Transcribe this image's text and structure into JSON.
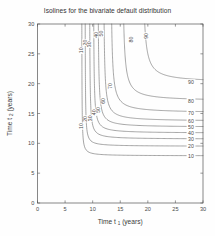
{
  "figure": {
    "title": "Isolines for the bivariate default distribution",
    "background_color": "#ffffff",
    "line_color": "#6f6f6f",
    "axis_color": "#555555",
    "text_color": "#3a3a3a"
  },
  "chart_data": {
    "type": "line",
    "subtype": "contour",
    "title": "Isolines for the bivariate default distribution",
    "xlabel": "Time t_1 (years)",
    "xlabel_main": "Time t",
    "xlabel_sub": "1",
    "xlabel_unit": "(years)",
    "ylabel": "Time t_2 (years)",
    "ylabel_main": "Time t",
    "ylabel_sub": "2",
    "ylabel_unit": "(years)",
    "xlim": [
      0,
      30
    ],
    "ylim": [
      0,
      30
    ],
    "xticks": [
      0,
      5,
      10,
      15,
      20,
      25,
      30
    ],
    "yticks": [
      0,
      5,
      10,
      15,
      20,
      25,
      30
    ],
    "xticklabels": [
      "0",
      "5",
      "10",
      "15",
      "20",
      "25",
      "30"
    ],
    "yticklabels": [
      "0",
      "5",
      "10",
      "15",
      "20",
      "25",
      "30"
    ],
    "grid": false,
    "legend": "none",
    "levels": [
      10,
      20,
      30,
      40,
      50,
      60,
      70,
      80,
      90
    ],
    "level_labels": [
      "10",
      "20",
      "30",
      "40",
      "50",
      "60",
      "70",
      "80",
      "90"
    ],
    "series": [
      {
        "name": "10",
        "level": 10,
        "x_asymptote": 8.0,
        "y_asymptote": 7.9,
        "knee_x": 8.9,
        "knee_y": 8.8
      },
      {
        "name": "20",
        "level": 20,
        "x_asymptote": 8.6,
        "y_asymptote": 9.5,
        "knee_x": 9.7,
        "knee_y": 10.4
      },
      {
        "name": "30",
        "level": 30,
        "x_asymptote": 9.4,
        "y_asymptote": 10.7,
        "knee_x": 10.7,
        "knee_y": 11.8
      },
      {
        "name": "40",
        "level": 40,
        "x_asymptote": 10.1,
        "y_asymptote": 11.7,
        "knee_x": 11.6,
        "knee_y": 12.9
      },
      {
        "name": "50",
        "level": 50,
        "x_asymptote": 10.9,
        "y_asymptote": 12.7,
        "knee_x": 12.6,
        "knee_y": 14.0
      },
      {
        "name": "60",
        "level": 60,
        "x_asymptote": 11.9,
        "y_asymptote": 13.7,
        "knee_x": 13.8,
        "knee_y": 15.2
      },
      {
        "name": "70",
        "level": 70,
        "x_asymptote": 13.2,
        "y_asymptote": 15.1,
        "knee_x": 15.4,
        "knee_y": 16.8
      },
      {
        "name": "80",
        "level": 80,
        "x_asymptote": 15.3,
        "y_asymptote": 17.1,
        "knee_x": 17.6,
        "knee_y": 19.0
      },
      {
        "name": "90",
        "level": 90,
        "x_asymptote": 18.9,
        "y_asymptote": 20.2,
        "knee_x": 21.3,
        "knee_y": 22.4
      }
    ],
    "inline_labels_vertical": [
      {
        "text": "10",
        "level": 10,
        "x": 8.0,
        "y": 25.6
      },
      {
        "text": "20",
        "level": 20,
        "x": 8.6,
        "y": 26.9
      },
      {
        "text": "30",
        "level": 30,
        "x": 9.4,
        "y": 26.6
      },
      {
        "text": "40",
        "level": 40,
        "x": 10.6,
        "y": 28.2
      },
      {
        "text": "50",
        "level": 50,
        "x": 11.6,
        "y": 28.4
      },
      {
        "text": "80",
        "level": 80,
        "x": 16.9,
        "y": 27.4
      },
      {
        "text": "90",
        "level": 90,
        "x": 19.7,
        "y": 28.0
      },
      {
        "text": "10",
        "level": 10,
        "x": 8.0,
        "y": 12.9
      },
      {
        "text": "20",
        "level": 20,
        "x": 8.7,
        "y": 14.1
      },
      {
        "text": "30",
        "level": 30,
        "x": 9.5,
        "y": 14.2
      },
      {
        "text": "40",
        "level": 40,
        "x": 10.3,
        "y": 15.2
      },
      {
        "text": "50",
        "level": 50,
        "x": 11.0,
        "y": 15.6
      },
      {
        "text": "60",
        "level": 60,
        "x": 11.9,
        "y": 17.1
      },
      {
        "text": "70",
        "level": 70,
        "x": 13.2,
        "y": 19.6
      }
    ],
    "edge_labels_right": [
      {
        "text": "90",
        "level": 90,
        "y": 20.2
      },
      {
        "text": "80",
        "level": 80,
        "y": 17.1
      },
      {
        "text": "70",
        "level": 70,
        "y": 15.1
      },
      {
        "text": "60",
        "level": 60,
        "y": 13.7
      },
      {
        "text": "50",
        "level": 50,
        "y": 12.7
      },
      {
        "text": "40",
        "level": 40,
        "y": 11.7
      },
      {
        "text": "30",
        "level": 30,
        "y": 10.7
      },
      {
        "text": "20",
        "level": 20,
        "y": 9.5
      },
      {
        "text": "10",
        "level": 10,
        "y": 7.9
      }
    ]
  }
}
